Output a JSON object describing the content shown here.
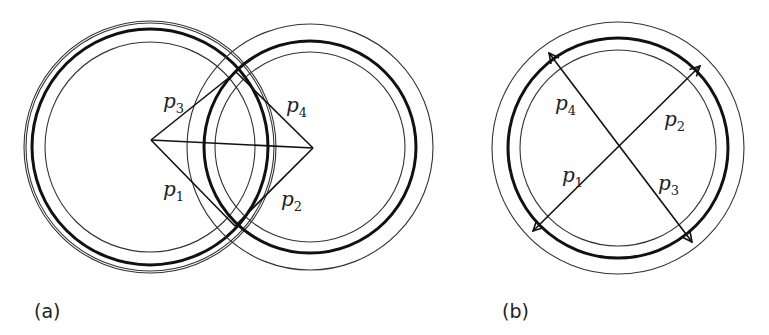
{
  "figure": {
    "panels": [
      {
        "id": "a",
        "caption": "(a)",
        "description": "Two overlapping ring sets with rhombus of paths p1-p4 between centers",
        "rings": [
          {
            "name": "left",
            "cx": 150,
            "cy": 147,
            "outer_r": 126,
            "outer2_r": 124,
            "thick_r": 118,
            "inner_r": 105
          },
          {
            "name": "right",
            "cx": 310,
            "cy": 147,
            "outer_r": 123,
            "thick_r": 106,
            "inner_r": 95
          }
        ],
        "rhombus": {
          "left": [
            151,
            140
          ],
          "top": [
            236,
            72
          ],
          "right": [
            313,
            148
          ],
          "bottom": [
            235,
            226
          ]
        },
        "labels": [
          {
            "base": "p",
            "sub": "3",
            "x": 165,
            "y": 106
          },
          {
            "base": "p",
            "sub": "4",
            "x": 287,
            "y": 110
          },
          {
            "base": "p",
            "sub": "1",
            "x": 165,
            "y": 195
          },
          {
            "base": "p",
            "sub": "2",
            "x": 282,
            "y": 204
          }
        ]
      },
      {
        "id": "b",
        "caption": "(b)",
        "description": "Single ring set with crossing arrows p1-p4 through center",
        "rings": [
          {
            "name": "center",
            "cx": 618,
            "cy": 148,
            "outer_r": 126,
            "thick_r": 110,
            "inner_r": 98
          }
        ],
        "arrows": [
          {
            "name": "p4-p3",
            "from": [
              549,
              53
            ],
            "to": [
              692,
              242
            ],
            "both_ends": true
          },
          {
            "name": "p2-p1",
            "from": [
              700,
              66
            ],
            "to": [
              533,
              231
            ],
            "both_ends": true
          }
        ],
        "labels": [
          {
            "base": "p",
            "sub": "4",
            "x": 556,
            "y": 108
          },
          {
            "base": "p",
            "sub": "2",
            "x": 665,
            "y": 124
          },
          {
            "base": "p",
            "sub": "1",
            "x": 563,
            "y": 180
          },
          {
            "base": "p",
            "sub": "3",
            "x": 659,
            "y": 188
          }
        ]
      }
    ]
  },
  "captions": {
    "a": "(a)",
    "b": "(b)"
  },
  "labels": {
    "a_p3": "p",
    "a_p3_sub": "3",
    "a_p4": "p",
    "a_p4_sub": "4",
    "a_p1": "p",
    "a_p1_sub": "1",
    "a_p2": "p",
    "a_p2_sub": "2",
    "b_p4": "p",
    "b_p4_sub": "4",
    "b_p2": "p",
    "b_p2_sub": "2",
    "b_p1": "p",
    "b_p1_sub": "1",
    "b_p3": "p",
    "b_p3_sub": "3"
  },
  "colors": {
    "stroke": "#111111",
    "thin_stroke": "#333333",
    "background": "#ffffff"
  }
}
